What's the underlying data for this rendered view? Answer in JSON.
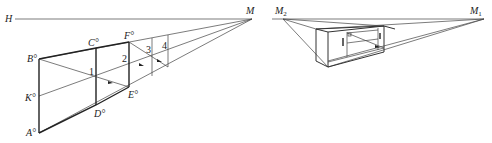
{
  "left_figure": {
    "horizon_label": "H",
    "vanishing_point_label": "M",
    "points": {
      "A": "A°",
      "B": "B°",
      "C": "C°",
      "D": "D°",
      "E": "E°",
      "F": "F°",
      "K": "K°"
    },
    "numbers": [
      "1",
      "2",
      "3",
      "4"
    ]
  },
  "right_figure": {
    "vanishing_point_left": "M",
    "vanishing_point_left_sub": "2",
    "vanishing_point_right": "M",
    "vanishing_point_right_sub": "1"
  },
  "colors": {
    "line": "#222222",
    "background": "#ffffff"
  }
}
